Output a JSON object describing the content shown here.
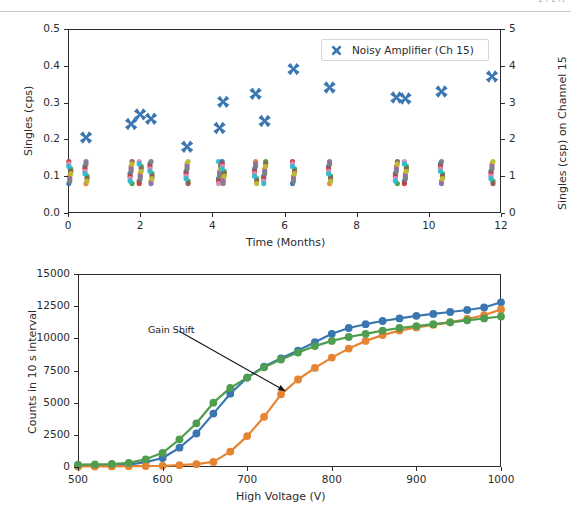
{
  "topbar": {
    "fragment_text": "2 r 2 rt"
  },
  "figures": [
    {
      "name": "singles-vs-time",
      "chart_data": {
        "type": "scatter",
        "title": "",
        "xlabel": "Time (Months)",
        "ylabel": "Singles (cps)",
        "y2label": "Singles (csp) on Channel 15",
        "xlim": [
          0,
          12
        ],
        "ylim": [
          0.0,
          0.5
        ],
        "y2lim": [
          0,
          5
        ],
        "xticks": [
          0,
          2,
          4,
          6,
          8,
          10,
          12
        ],
        "yticks": [
          "0.0",
          "0.1",
          "0.2",
          "0.3",
          "0.4",
          "0.5"
        ],
        "y2ticks": [
          0,
          1,
          2,
          3,
          4,
          5
        ],
        "grid": false,
        "legend": {
          "position": "upper center",
          "entries": [
            "Noisy Amplifier (Ch 15)"
          ]
        },
        "series": [
          {
            "name": "Noisy Amplifier (Ch 15)",
            "marker": "X",
            "color": "#3a76af",
            "axis": "right",
            "points": [
              [
                0.5,
                0.205
              ],
              [
                1.75,
                0.242
              ],
              [
                2.0,
                0.268
              ],
              [
                2.3,
                0.256
              ],
              [
                3.3,
                0.18
              ],
              [
                4.2,
                0.231
              ],
              [
                4.3,
                0.302
              ],
              [
                5.2,
                0.324
              ],
              [
                5.45,
                0.25
              ],
              [
                6.25,
                0.391
              ],
              [
                7.25,
                0.341
              ],
              [
                9.1,
                0.314
              ],
              [
                9.35,
                0.311
              ],
              [
                10.35,
                0.33
              ],
              [
                11.75,
                0.371
              ]
            ]
          },
          {
            "name": "Other channels (low cluster)",
            "marker": "o",
            "colors": [
              "#3a76af",
              "#e58433",
              "#4f9d4f",
              "#c2403d",
              "#8f6bb5",
              "#8c5d52",
              "#d98bc0",
              "#7f7f7f",
              "#b9bd35",
              "#28bdcf"
            ],
            "axis": "left",
            "note": "Dense overlapping clusters near 0.08-0.14 cps (about 1 csp)",
            "cluster_x": [
              0.05,
              0.5,
              1.75,
              2.0,
              2.3,
              3.3,
              4.2,
              4.3,
              5.2,
              5.45,
              6.25,
              7.25,
              9.1,
              9.35,
              10.35,
              11.75
            ],
            "cluster_y_range": [
              0.08,
              0.14
            ]
          }
        ]
      }
    },
    {
      "name": "counts-vs-high-voltage",
      "chart_data": {
        "type": "line",
        "title": "",
        "xlabel": "High Voltage (V)",
        "ylabel": "Counts in 10 s interval",
        "xlim": [
          500,
          1000
        ],
        "ylim": [
          0,
          15000
        ],
        "xticks": [
          500,
          600,
          700,
          800,
          900,
          1000
        ],
        "yticks": [
          0,
          2500,
          5000,
          7500,
          10000,
          12500,
          15000
        ],
        "grid": false,
        "legend": null,
        "annotations": [
          {
            "text": "Gain Shift",
            "text_xy": [
              615,
              10400
            ],
            "arrow_to_xy": [
              745,
              5900
            ]
          }
        ],
        "x": [
          500,
          520,
          540,
          560,
          580,
          600,
          620,
          640,
          660,
          680,
          700,
          720,
          740,
          760,
          780,
          800,
          820,
          840,
          860,
          880,
          900,
          920,
          940,
          960,
          980,
          1000
        ],
        "series": [
          {
            "name": "Channel A",
            "color": "#3a76af",
            "marker": "o",
            "values": [
              80,
              90,
              110,
              180,
              380,
              700,
              1500,
              2600,
              4150,
              5700,
              6950,
              7800,
              8450,
              9050,
              9700,
              10350,
              10800,
              11100,
              11350,
              11550,
              11750,
              11900,
              12050,
              12200,
              12400,
              12800
            ]
          },
          {
            "name": "Channel B",
            "color": "#e58433",
            "marker": "o",
            "values": [
              40,
              45,
              50,
              60,
              75,
              95,
              140,
              220,
              400,
              1200,
              2400,
              3900,
              5650,
              6800,
              7700,
              8500,
              9200,
              9800,
              10250,
              10600,
              10850,
              11050,
              11250,
              11500,
              11800,
              12250
            ]
          },
          {
            "name": "Channel C",
            "color": "#4f9d4f",
            "marker": "o",
            "values": [
              180,
              200,
              230,
              330,
              600,
              1100,
              2150,
              3400,
              5000,
              6150,
              6950,
              7750,
              8350,
              8900,
              9400,
              9800,
              10100,
              10350,
              10600,
              10800,
              10950,
              11100,
              11250,
              11400,
              11550,
              11700
            ]
          }
        ]
      }
    }
  ]
}
